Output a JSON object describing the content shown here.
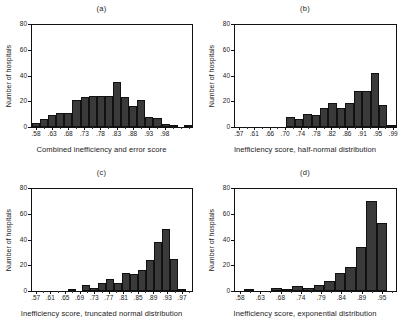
{
  "figure": {
    "panels": [
      {
        "id": "a",
        "title": "(a)",
        "xlabel": "Combined inefficiency and error score",
        "ylabel": "Number of hospitals"
      },
      {
        "id": "b",
        "title": "(b)",
        "xlabel": "Inefficiency score, half-normal distribution",
        "ylabel": "Number of hospitals"
      },
      {
        "id": "c",
        "title": "(c)",
        "xlabel": "Inefficiency score, truncated normal distribution",
        "ylabel": "Number of hospitals"
      },
      {
        "id": "d",
        "title": "(d)",
        "xlabel": "Inefficiency score, exponential distribution",
        "ylabel": "Number of hospitals"
      }
    ]
  },
  "chart_data": [
    {
      "type": "bar",
      "panel": "a",
      "title": "(a)",
      "xlabel": "Combined inefficiency and error score",
      "ylabel": "Number of hospitals",
      "ylim": [
        0,
        80
      ],
      "yticks": [
        0,
        20,
        40,
        60,
        80
      ],
      "ytick_labels": [
        "0",
        "20",
        "40",
        "60",
        "80"
      ],
      "xtick_labels": [
        ".58",
        ".63",
        ".68",
        ".73",
        ".78",
        ".83",
        ".88",
        ".93",
        ".98"
      ],
      "xtick_positions": [
        0.5,
        2.5,
        4.5,
        6.5,
        8.5,
        10.5,
        12.5,
        14.5,
        16.5
      ],
      "grid": false,
      "legend": null,
      "bar_color": "#3a3a3a",
      "categories": [
        "bin1",
        "bin2",
        "bin3",
        "bin4",
        "bin5",
        "bin6",
        "bin7",
        "bin8",
        "bin9",
        "bin10",
        "bin11",
        "bin12",
        "bin13",
        "bin14",
        "bin15",
        "bin16",
        "bin17",
        "bin18",
        "bin19",
        "bin20"
      ],
      "values": [
        3,
        6,
        9,
        11,
        11,
        21,
        23,
        24,
        24,
        24,
        35,
        23,
        16,
        21,
        8,
        7,
        2,
        1,
        0,
        1
      ]
    },
    {
      "type": "bar",
      "panel": "b",
      "title": "(b)",
      "xlabel": "Inefficiency score, half-normal distribution",
      "ylabel": "Number of hospitals",
      "ylim": [
        0,
        80
      ],
      "yticks": [
        0,
        20,
        40,
        60,
        80
      ],
      "ytick_labels": [
        "0",
        "20",
        "40",
        "60",
        "80"
      ],
      "xtick_labels": [
        ".57",
        ".61",
        ".66",
        ".70",
        ".74",
        ".78",
        ".82",
        ".86",
        ".91",
        ".95",
        ".99"
      ],
      "xtick_positions": [
        0.5,
        2.5,
        4.5,
        6.5,
        8.5,
        10.5,
        12.5,
        14.5,
        16.5,
        18.5,
        20.5
      ],
      "grid": false,
      "legend": null,
      "bar_color": "#3a3a3a",
      "categories": [
        "bin1",
        "bin2",
        "bin3",
        "bin4",
        "bin5",
        "bin6",
        "bin7",
        "bin8",
        "bin9",
        "bin10",
        "bin11",
        "bin12",
        "bin13",
        "bin14",
        "bin15",
        "bin16",
        "bin17",
        "bin18",
        "bin19",
        "bin20",
        "bin21"
      ],
      "values": [
        0,
        0,
        0,
        0,
        0,
        0,
        0,
        0,
        8,
        6,
        10,
        9,
        15,
        19,
        15,
        19,
        28,
        28,
        42,
        17,
        1
      ]
    },
    {
      "type": "bar",
      "panel": "c",
      "title": "(c)",
      "xlabel": "Inefficiency score, truncated normal distribution",
      "ylabel": "Number of hospitals",
      "ylim": [
        0,
        80
      ],
      "yticks": [
        0,
        20,
        40,
        60,
        80
      ],
      "ytick_labels": [
        "0",
        "20",
        "40",
        "60",
        "80"
      ],
      "xtick_labels": [
        ".57",
        ".61",
        ".65",
        ".69",
        ".73",
        ".77",
        ".81",
        ".85",
        ".89",
        ".93",
        ".97"
      ],
      "xtick_positions": [
        0.5,
        2.5,
        4.5,
        6.5,
        8.5,
        10.5,
        12.5,
        14.5,
        16.5,
        18.5,
        20.5
      ],
      "grid": false,
      "legend": null,
      "bar_color": "#3a3a3a",
      "categories": [
        "bin1",
        "bin2",
        "bin3",
        "bin4",
        "bin5",
        "bin6",
        "bin7",
        "bin8",
        "bin9",
        "bin10",
        "bin11",
        "bin12",
        "bin13",
        "bin14",
        "bin15",
        "bin16",
        "bin17",
        "bin18",
        "bin19",
        "bin20",
        "bin21",
        "bin22"
      ],
      "values": [
        0,
        0,
        0,
        0,
        0,
        0,
        1,
        0,
        5,
        2,
        6,
        9,
        6,
        14,
        13,
        16,
        24,
        38,
        48,
        25,
        1,
        0
      ]
    },
    {
      "type": "bar",
      "panel": "d",
      "title": "(d)",
      "xlabel": "Inefficiency score, exponential distribution",
      "ylabel": "Number of hospitals",
      "ylim": [
        0,
        80
      ],
      "yticks": [
        0,
        20,
        40,
        60,
        80
      ],
      "ytick_labels": [
        "0",
        "20",
        "40",
        "60",
        "80"
      ],
      "xtick_labels": [
        ".58",
        ".63",
        ".68",
        ".74",
        ".79",
        ".84",
        ".89",
        ".95"
      ],
      "xtick_positions": [
        0.5,
        2.5,
        4.5,
        6.5,
        8.5,
        10.5,
        12.5,
        14.5
      ],
      "grid": false,
      "legend": null,
      "bar_color": "#3a3a3a",
      "categories": [
        "bin1",
        "bin2",
        "bin3",
        "bin4",
        "bin5",
        "bin6",
        "bin7",
        "bin8",
        "bin9",
        "bin10",
        "bin11",
        "bin12",
        "bin13",
        "bin14",
        "bin15",
        "bin16"
      ],
      "values": [
        0,
        1,
        0,
        0,
        2,
        1,
        4,
        2,
        5,
        8,
        14,
        19,
        34,
        70,
        53,
        0
      ]
    }
  ]
}
